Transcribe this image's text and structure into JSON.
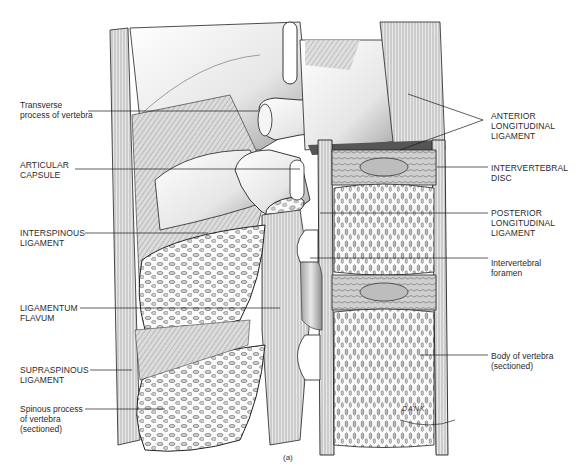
{
  "figure": {
    "caption": "(a)",
    "signature": "DANK",
    "colors": {
      "background": "#ffffff",
      "line": "#1a1a1a",
      "bone_light": "#f2f2f2",
      "bone_shade": "#9a9a9a",
      "ligament": "#bdbdbd"
    }
  },
  "labels": {
    "left": [
      {
        "id": "transverse-process",
        "text": "Transverse\nprocess of vertebra"
      },
      {
        "id": "articular-capsule",
        "text": "ARTICULAR\nCAPSULE"
      },
      {
        "id": "interspinous-ligament",
        "text": "INTERSPINOUS\nLIGAMENT"
      },
      {
        "id": "ligamentum-flavum",
        "text": "LIGAMENTUM\nFLAVUM"
      },
      {
        "id": "supraspinous-ligament",
        "text": "SUPRASPINOUS\nLIGAMENT"
      },
      {
        "id": "spinous-process",
        "text": "Spinous process\nof vertebra\n(sectioned)"
      }
    ],
    "right": [
      {
        "id": "anterior-longitudinal-ligament",
        "text": "ANTERIOR\nLONGITUDINAL\nLIGAMENT"
      },
      {
        "id": "intervertebral-disc",
        "text": "INTERVERTEBRAL\nDISC"
      },
      {
        "id": "posterior-longitudinal-ligament",
        "text": "POSTERIOR\nLONGITUDINAL\nLIGAMENT"
      },
      {
        "id": "intervertebral-foramen",
        "text": "Intervertebral\nforamen"
      },
      {
        "id": "body-of-vertebra",
        "text": "Body of vertebra\n(sectioned)"
      }
    ]
  }
}
